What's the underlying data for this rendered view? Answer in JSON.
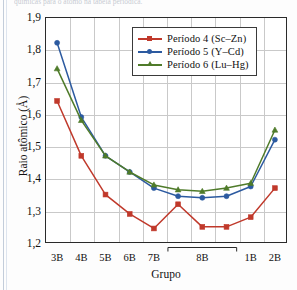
{
  "top_caption": "químicas para o átomo na tabela periódica.",
  "chart_data": {
    "type": "line",
    "title": "",
    "xlabel": "Grupo",
    "ylabel": "Raio atômico (Å)",
    "categories": [
      "3B",
      "4B",
      "5B",
      "6B",
      "7B",
      "8B",
      "8B",
      "8B",
      "1B",
      "2B"
    ],
    "tick_labels": [
      "3B",
      "4B",
      "5B",
      "6B",
      "7B",
      "8B",
      "1B",
      "2B"
    ],
    "group_8b_bracket_label": "8B",
    "ylim": [
      1.2,
      1.9
    ],
    "ytick_labels": [
      "1,2",
      "1,3",
      "1,4",
      "1,5",
      "1,6",
      "1,7",
      "1,8",
      "1,9"
    ],
    "ytick_values": [
      1.2,
      1.3,
      1.4,
      1.5,
      1.6,
      1.7,
      1.8,
      1.9
    ],
    "grid": true,
    "legend_position": "top-right-inside",
    "series": [
      {
        "name": "Período 4 (Sc–Zn)",
        "color": "#c0392b",
        "marker": "square",
        "values": [
          1.64,
          1.47,
          1.35,
          1.29,
          1.245,
          1.32,
          1.25,
          1.25,
          1.28,
          1.37
        ]
      },
      {
        "name": "Período 5 (Y–Cd)",
        "color": "#2c5aa0",
        "marker": "circle",
        "values": [
          1.82,
          1.59,
          1.47,
          1.42,
          1.37,
          1.345,
          1.34,
          1.345,
          1.375,
          1.52
        ]
      },
      {
        "name": "Período 6 (Lu–Hg)",
        "color": "#4f7b2a",
        "marker": "triangle",
        "values": [
          1.74,
          1.58,
          1.47,
          1.42,
          1.38,
          1.365,
          1.36,
          1.37,
          1.385,
          1.55
        ]
      }
    ]
  }
}
